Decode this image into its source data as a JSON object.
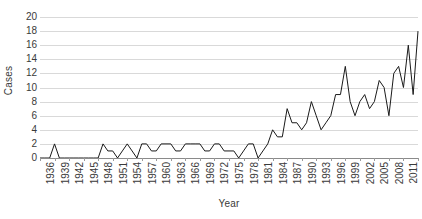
{
  "chart_data": {
    "type": "line",
    "title": "",
    "xlabel": "Year",
    "ylabel": "Cases",
    "xlim": [
      1936,
      2014
    ],
    "ylim": [
      0,
      20
    ],
    "ytick_values": [
      0,
      2,
      4,
      6,
      8,
      10,
      12,
      14,
      16,
      18,
      20
    ],
    "ytick_labels": [
      "0",
      "2",
      "4",
      "6",
      "8",
      "10",
      "12",
      "14",
      "16",
      "18",
      "20"
    ],
    "xtick_values": [
      1936,
      1939,
      1942,
      1945,
      1948,
      1951,
      1954,
      1957,
      1960,
      1963,
      1966,
      1969,
      1972,
      1975,
      1978,
      1981,
      1984,
      1987,
      1990,
      1993,
      1996,
      1999,
      2002,
      2005,
      2008,
      2011,
      2014
    ],
    "xtick_labels": [
      "1936",
      "1939",
      "1942",
      "1945",
      "1948",
      "1951",
      "1954",
      "1957",
      "1960",
      "1963",
      "1966",
      "1969",
      "1972",
      "1975",
      "1978",
      "1981",
      "1984",
      "1987",
      "1990",
      "1993",
      "1996",
      "1999",
      "2002",
      "2005",
      "2008",
      "2011",
      "2014"
    ],
    "grid": true,
    "grid_axis": "y",
    "grid_color": "#d9d9d9",
    "legend": false,
    "line_color": "#1a1a1a",
    "line_width": 1,
    "markers": false,
    "x": [
      1936,
      1937,
      1938,
      1939,
      1940,
      1941,
      1942,
      1943,
      1944,
      1945,
      1946,
      1947,
      1948,
      1949,
      1950,
      1951,
      1952,
      1953,
      1954,
      1955,
      1956,
      1957,
      1958,
      1959,
      1960,
      1961,
      1962,
      1963,
      1964,
      1965,
      1966,
      1967,
      1968,
      1969,
      1970,
      1971,
      1972,
      1973,
      1974,
      1975,
      1976,
      1977,
      1978,
      1979,
      1980,
      1981,
      1982,
      1983,
      1984,
      1985,
      1986,
      1987,
      1988,
      1989,
      1990,
      1991,
      1992,
      1993,
      1994,
      1995,
      1996,
      1997,
      1998,
      1999,
      2000,
      2001,
      2002,
      2003,
      2004,
      2005,
      2006,
      2007,
      2008,
      2009,
      2010,
      2011,
      2012,
      2013,
      2014
    ],
    "values": [
      0,
      0,
      0,
      2,
      0,
      0,
      0,
      0,
      0,
      0,
      0,
      0,
      0,
      2,
      1,
      1,
      0,
      1,
      2,
      1,
      0,
      2,
      2,
      1,
      1,
      2,
      2,
      2,
      1,
      1,
      2,
      2,
      2,
      2,
      1,
      1,
      2,
      2,
      1,
      1,
      1,
      0,
      1,
      2,
      2,
      0,
      1,
      2,
      4,
      3,
      3,
      7,
      5,
      5,
      4,
      5,
      8,
      6,
      4,
      5,
      6,
      9,
      9,
      13,
      8,
      6,
      8,
      9,
      7,
      8,
      11,
      10,
      6,
      12,
      13,
      10,
      16,
      9,
      18
    ],
    "series": [
      {
        "name": "Cases",
        "values": [
          0,
          0,
          0,
          2,
          0,
          0,
          0,
          0,
          0,
          0,
          0,
          0,
          0,
          2,
          1,
          1,
          0,
          1,
          2,
          1,
          0,
          2,
          2,
          1,
          1,
          2,
          2,
          2,
          1,
          1,
          2,
          2,
          2,
          2,
          1,
          1,
          2,
          2,
          1,
          1,
          1,
          0,
          1,
          2,
          2,
          0,
          1,
          2,
          4,
          3,
          3,
          7,
          5,
          5,
          4,
          5,
          8,
          6,
          4,
          5,
          6,
          9,
          9,
          13,
          8,
          6,
          8,
          9,
          7,
          8,
          11,
          10,
          6,
          12,
          13,
          10,
          16,
          9,
          18
        ]
      }
    ]
  }
}
